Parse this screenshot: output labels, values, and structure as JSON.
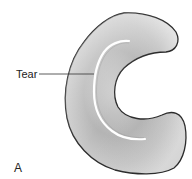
{
  "diagram": {
    "labels": {
      "tear": "Tear",
      "panel": "A"
    },
    "colors": {
      "shape_fill_light": "#e6e6e6",
      "shape_fill_dark": "#a9a9a9",
      "outline": "#2b2b2b",
      "tear": "#ffffff",
      "leader_line": "#333333",
      "background": "#ffffff"
    }
  }
}
